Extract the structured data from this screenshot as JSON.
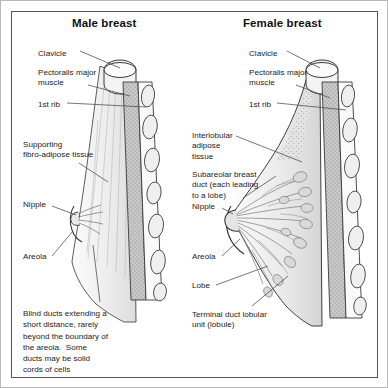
{
  "figure": {
    "kind": "anatomical-diagram",
    "frame_color": "#54565a",
    "background": "#ffffff",
    "text_color": "#1b1b1b"
  },
  "panels": {
    "male": {
      "title": "Male breast",
      "labels": {
        "clavicle": "Clavicle",
        "pectoralis": "Pectoralis major\nmuscle",
        "first_rib": "1st rib",
        "supporting": "Supporting\nfibro-adipose tissue",
        "nipple": "Nipple",
        "areola": "Areola"
      },
      "caption": "Blind ducts extending a\nshort distance, rarely\nbeyond the boundary of\nthe areola.  Some\nducts may be solid\ncords of cells"
    },
    "female": {
      "title": "Female breast",
      "labels": {
        "clavicle": "Clavicle",
        "pectoralis": "Pectoralis major\nmuscle",
        "first_rib": "1st rib",
        "interlobular": "Interlobular\nadipose\ntissue",
        "subareolar": "Subareolar breast\nduct (each leading\nto a lobe)",
        "nipple": "Nipple",
        "areola": "Areola",
        "lobe": "Lobe",
        "tdlu": "Terminal duct lobular\nunit (lobule)"
      }
    }
  },
  "art_colors": {
    "outline": "#3a3a3a",
    "muscle_fill": "#a8a8a8",
    "rib_fill": "#ececec",
    "adipose_fill": "#d6d6d6",
    "breast_fill": "#f2f2f2",
    "duct_stroke": "#6e6e6e",
    "leader_line": "#4a4a4a"
  }
}
